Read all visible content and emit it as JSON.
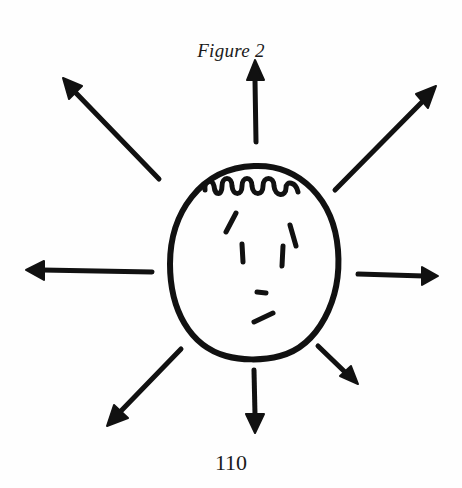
{
  "figure": {
    "caption": "Figure 2",
    "page_number": "110",
    "ink_color": "#111111",
    "background_color": "#fefefe",
    "face": {
      "shape": "circle-ellipse",
      "hair": "curly-scalloped",
      "eyebrows": 2,
      "eyes": 2,
      "nose": "short dash",
      "mouth": "slanted dash"
    },
    "arrows": [
      {
        "direction": "up"
      },
      {
        "direction": "up-right"
      },
      {
        "direction": "right"
      },
      {
        "direction": "down-right"
      },
      {
        "direction": "down"
      },
      {
        "direction": "down-left"
      },
      {
        "direction": "left"
      },
      {
        "direction": "up-left"
      }
    ]
  }
}
